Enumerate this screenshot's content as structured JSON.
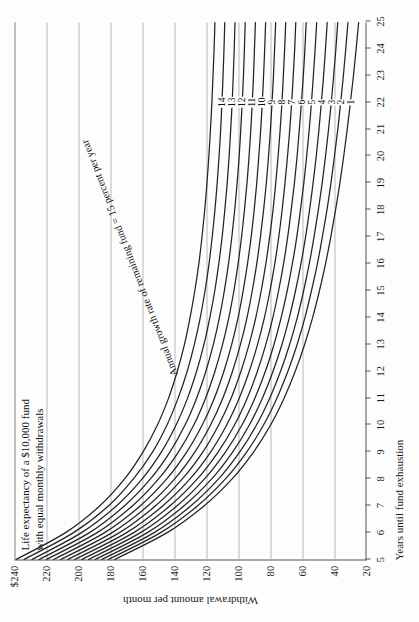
{
  "chart_data": {
    "type": "line",
    "title": "Life expectancy of a $10,000 fund\nwith equal monthly withdrawals",
    "xlabel": "Years until fund exhaustion",
    "ylabel": "Withdrawal amount per month",
    "xlim": [
      5,
      25
    ],
    "ylim": [
      20,
      240
    ],
    "xticks": [
      5,
      6,
      7,
      8,
      9,
      10,
      11,
      12,
      13,
      14,
      15,
      16,
      17,
      18,
      19,
      20,
      21,
      22,
      23,
      24,
      25
    ],
    "yticks": [
      20,
      40,
      60,
      80,
      100,
      120,
      140,
      160,
      180,
      200,
      220,
      240
    ],
    "ytick_labels": [
      "20",
      "40",
      "60",
      "80",
      "100",
      "120",
      "140",
      "160",
      "180",
      "200",
      "220",
      "$240"
    ],
    "grid": "y-gridlines only (vertical rules at each $20 level)",
    "legend_position": "inline curve labels at x = 22",
    "annotation": "Annual growth rate of remaining fund = 15 percent per year",
    "annotation_label_x": 22,
    "series": [
      {
        "name": "15",
        "rate_percent": 15,
        "x": [
          5,
          6,
          7,
          8,
          9,
          10,
          11,
          12,
          13,
          14,
          15,
          16,
          17,
          18,
          19,
          20,
          21,
          22,
          23,
          24,
          25
        ],
        "values": [
          239.0,
          208.0,
          186.5,
          171.0,
          159.5,
          150.5,
          143.5,
          138.0,
          133.5,
          130.0,
          127.0,
          124.5,
          122.5,
          120.8,
          119.4,
          118.2,
          117.2,
          116.3,
          115.6,
          114.9,
          114.4
        ]
      },
      {
        "name": "14",
        "rate_percent": 14,
        "x": [
          5,
          6,
          7,
          8,
          9,
          10,
          11,
          12,
          13,
          14,
          15,
          16,
          17,
          18,
          19,
          20,
          21,
          22,
          23,
          24,
          25
        ],
        "values": [
          234.0,
          203.0,
          181.0,
          165.5,
          153.5,
          144.5,
          137.5,
          131.8,
          127.3,
          123.6,
          120.6,
          118.1,
          116.1,
          114.4,
          113.0,
          111.8,
          110.8,
          110.0,
          109.3,
          108.7,
          108.2
        ]
      },
      {
        "name": "13",
        "rate_percent": 13,
        "x": [
          5,
          6,
          7,
          8,
          9,
          10,
          11,
          12,
          13,
          14,
          15,
          16,
          17,
          18,
          19,
          20,
          21,
          22,
          23,
          24,
          25
        ],
        "values": [
          229.0,
          198.0,
          176.0,
          160.0,
          148.0,
          138.8,
          131.6,
          125.9,
          121.3,
          117.6,
          114.5,
          112.0,
          109.9,
          108.2,
          106.7,
          105.5,
          104.5,
          103.6,
          102.9,
          102.3,
          101.8
        ]
      },
      {
        "name": "12",
        "rate_percent": 12,
        "x": [
          5,
          6,
          7,
          8,
          9,
          10,
          11,
          12,
          13,
          14,
          15,
          16,
          17,
          18,
          19,
          20,
          21,
          22,
          23,
          24,
          25
        ],
        "values": [
          224.5,
          193.0,
          171.0,
          154.8,
          142.6,
          133.2,
          125.9,
          120.1,
          115.4,
          111.6,
          108.5,
          105.9,
          103.8,
          102.0,
          100.5,
          99.2,
          98.2,
          97.3,
          96.5,
          95.9,
          95.4
        ]
      },
      {
        "name": "11",
        "rate_percent": 11,
        "x": [
          5,
          6,
          7,
          8,
          9,
          10,
          11,
          12,
          13,
          14,
          15,
          16,
          17,
          18,
          19,
          20,
          21,
          22,
          23,
          24,
          25
        ],
        "values": [
          220.0,
          188.2,
          166.0,
          149.7,
          137.3,
          127.7,
          120.3,
          114.4,
          109.6,
          105.7,
          102.5,
          99.9,
          97.7,
          95.9,
          94.3,
          93.0,
          91.9,
          91.0,
          90.2,
          89.6,
          89.0
        ]
      },
      {
        "name": "10",
        "rate_percent": 10,
        "x": [
          5,
          6,
          7,
          8,
          9,
          10,
          11,
          12,
          13,
          14,
          15,
          16,
          17,
          18,
          19,
          20,
          21,
          22,
          23,
          24,
          25
        ],
        "values": [
          215.5,
          183.5,
          161.1,
          144.6,
          132.1,
          122.4,
          114.8,
          108.8,
          103.9,
          99.9,
          96.7,
          94.0,
          91.7,
          89.8,
          88.2,
          86.9,
          85.7,
          84.7,
          83.9,
          83.2,
          82.6
        ]
      },
      {
        "name": "9",
        "rate_percent": 9,
        "x": [
          5,
          6,
          7,
          8,
          9,
          10,
          11,
          12,
          13,
          14,
          15,
          16,
          17,
          18,
          19,
          20,
          21,
          22,
          23,
          24,
          25
        ],
        "values": [
          211.0,
          178.8,
          156.3,
          139.6,
          127.0,
          117.2,
          109.5,
          103.4,
          98.4,
          94.3,
          91.0,
          88.2,
          85.9,
          83.9,
          82.2,
          80.8,
          79.6,
          78.6,
          77.7,
          77.0,
          76.3
        ]
      },
      {
        "name": "8",
        "rate_percent": 8,
        "x": [
          5,
          6,
          7,
          8,
          9,
          10,
          11,
          12,
          13,
          14,
          15,
          16,
          17,
          18,
          19,
          20,
          21,
          22,
          23,
          24,
          25
        ],
        "values": [
          206.6,
          174.2,
          151.6,
          134.8,
          122.0,
          112.1,
          104.3,
          98.1,
          93.0,
          88.8,
          85.4,
          82.5,
          80.1,
          78.0,
          76.3,
          74.8,
          73.5,
          72.4,
          71.5,
          70.7,
          70.0
        ]
      },
      {
        "name": "7",
        "rate_percent": 7,
        "x": [
          5,
          6,
          7,
          8,
          9,
          10,
          11,
          12,
          13,
          14,
          15,
          16,
          17,
          18,
          19,
          20,
          21,
          22,
          23,
          24,
          25
        ],
        "values": [
          202.2,
          169.7,
          147.0,
          130.0,
          117.1,
          107.1,
          99.2,
          92.9,
          87.7,
          83.4,
          79.9,
          76.9,
          74.4,
          72.3,
          70.5,
          68.9,
          67.5,
          66.3,
          65.3,
          64.4,
          63.7
        ]
      },
      {
        "name": "6",
        "rate_percent": 6,
        "x": [
          5,
          6,
          7,
          8,
          9,
          10,
          11,
          12,
          13,
          14,
          15,
          16,
          17,
          18,
          19,
          20,
          21,
          22,
          23,
          24,
          25
        ],
        "values": [
          197.9,
          165.3,
          142.5,
          125.4,
          112.4,
          102.2,
          94.2,
          87.8,
          82.5,
          78.1,
          74.5,
          71.4,
          68.8,
          66.6,
          64.6,
          62.9,
          61.5,
          60.2,
          59.0,
          58.0,
          57.2
        ]
      },
      {
        "name": "5",
        "rate_percent": 5,
        "x": [
          5,
          6,
          7,
          8,
          9,
          10,
          11,
          12,
          13,
          14,
          15,
          16,
          17,
          18,
          19,
          20,
          21,
          22,
          23,
          24,
          25
        ],
        "values": [
          193.6,
          161.0,
          138.1,
          120.9,
          107.8,
          97.5,
          89.4,
          82.8,
          77.4,
          72.9,
          69.1,
          65.9,
          63.1,
          60.8,
          58.7,
          56.9,
          55.3,
          53.9,
          52.7,
          51.6,
          50.6
        ]
      },
      {
        "name": "4",
        "rate_percent": 4,
        "x": [
          5,
          6,
          7,
          8,
          9,
          10,
          11,
          12,
          13,
          14,
          15,
          16,
          17,
          18,
          19,
          20,
          21,
          22,
          23,
          24,
          25
        ],
        "values": [
          189.4,
          156.7,
          133.7,
          116.4,
          103.3,
          92.9,
          84.7,
          78.0,
          72.4,
          67.8,
          63.9,
          60.5,
          57.6,
          55.1,
          52.9,
          50.9,
          49.2,
          47.7,
          46.3,
          45.1,
          44.0
        ]
      },
      {
        "name": "3",
        "rate_percent": 3,
        "x": [
          5,
          6,
          7,
          8,
          9,
          10,
          11,
          12,
          13,
          14,
          15,
          16,
          17,
          18,
          19,
          20,
          21,
          22,
          23,
          24,
          25
        ],
        "values": [
          185.3,
          152.5,
          129.4,
          112.1,
          98.9,
          88.4,
          80.1,
          73.3,
          67.6,
          62.8,
          58.8,
          55.3,
          52.3,
          49.6,
          47.2,
          45.1,
          43.2,
          41.5,
          40.0,
          38.6,
          37.4
        ]
      },
      {
        "name": "2",
        "rate_percent": 2,
        "x": [
          5,
          6,
          7,
          8,
          9,
          10,
          11,
          12,
          13,
          14,
          15,
          16,
          17,
          18,
          19,
          20,
          21,
          22,
          23,
          24,
          25
        ],
        "values": [
          181.2,
          148.4,
          125.2,
          107.8,
          94.5,
          84.0,
          75.6,
          68.7,
          62.9,
          58.0,
          53.9,
          50.2,
          47.1,
          44.2,
          41.7,
          39.5,
          37.4,
          35.6,
          33.9,
          32.4,
          31.0
        ]
      },
      {
        "name": "1",
        "rate_percent": 1,
        "x": [
          5,
          6,
          7,
          8,
          9,
          10,
          11,
          12,
          13,
          14,
          15,
          16,
          17,
          18,
          19,
          20,
          21,
          22,
          23,
          24,
          25
        ],
        "values": [
          177.2,
          144.3,
          121.1,
          103.6,
          90.2,
          79.6,
          71.1,
          64.1,
          58.2,
          53.2,
          48.9,
          45.1,
          41.8,
          38.8,
          36.1,
          33.7,
          31.5,
          29.5,
          27.6,
          25.9,
          24.3
        ]
      }
    ]
  },
  "page": {
    "figure_label": "chart-figure"
  }
}
